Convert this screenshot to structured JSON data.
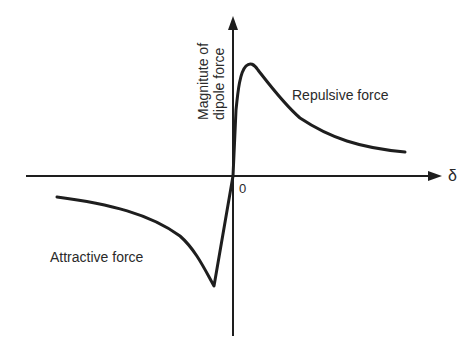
{
  "diagram": {
    "y_axis_label_line1": "Magnitute of",
    "y_axis_label_line2": "dipole force",
    "x_axis_label": "δ",
    "origin_label": "0",
    "repulsive_label": "Repulsive force",
    "attractive_label": "Attractive force"
  },
  "colors": {
    "stroke": "#1e1e1e",
    "text": "#2a2a2a",
    "background": "#ffffff"
  }
}
